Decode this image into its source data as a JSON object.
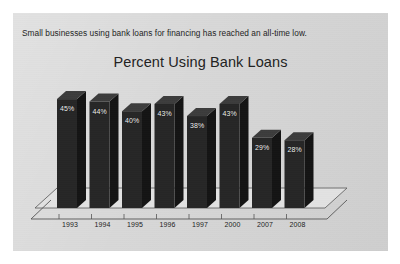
{
  "panel": {
    "caption": "Small businesses using bank loans for financing has reached an all-time low.",
    "background_color": "#d6d6d6",
    "page_background_color": "#ffffff"
  },
  "chart_data": {
    "type": "bar",
    "title": "Percent Using Bank Loans",
    "xlabel": "",
    "ylabel": "",
    "ylim": [
      0,
      50
    ],
    "grid": false,
    "legend": "none",
    "style": "3d-column",
    "bar_color": "#262626",
    "bar_top_color": "#3c3c3c",
    "bar_side_color": "#141414",
    "data_label_color": "#f2f2f2",
    "axis_color": "#555555",
    "categories": [
      "1993",
      "1994",
      "1995",
      "1996",
      "1997",
      "2000",
      "2007",
      "2008"
    ],
    "values": [
      45,
      44,
      40,
      43,
      38,
      43,
      29,
      28
    ],
    "data_labels": [
      "45%",
      "44%",
      "40%",
      "43%",
      "38%",
      "43%",
      "29%",
      "28%"
    ]
  }
}
